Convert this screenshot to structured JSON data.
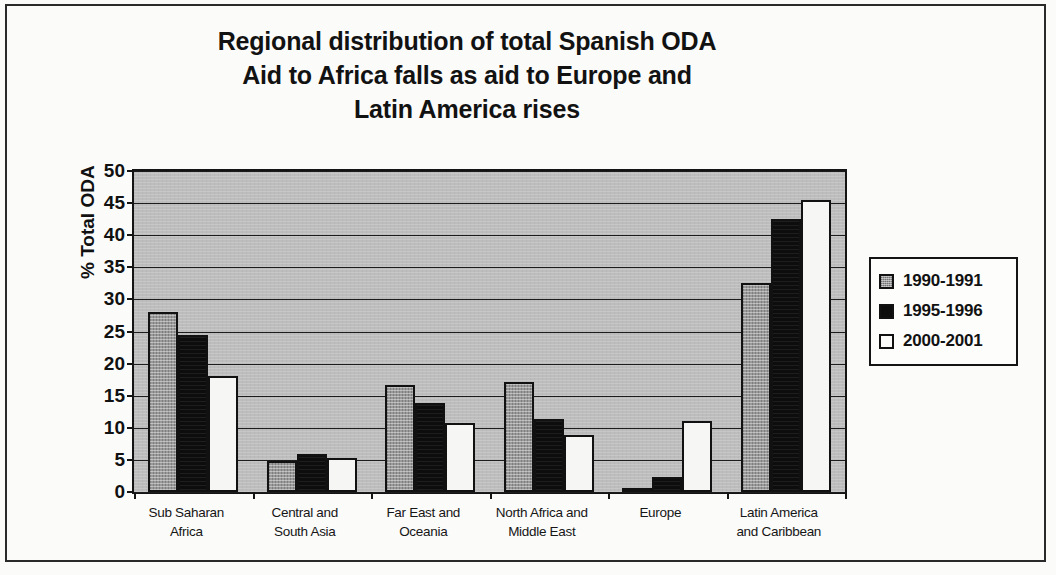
{
  "chart_data": {
    "type": "bar",
    "title": "Regional distribution of total Spanish ODA Aid to Africa falls as aid to Europe and Latin America rises",
    "title_lines": [
      "Regional distribution of total Spanish ODA",
      "Aid to Africa falls as aid to Europe and",
      "Latin America rises"
    ],
    "xlabel": "",
    "ylabel": "% Total ODA",
    "ylim": [
      0,
      50
    ],
    "ytick_step": 5,
    "yticks": [
      0,
      5,
      10,
      15,
      20,
      25,
      30,
      35,
      40,
      45,
      50
    ],
    "ytick_labels": [
      "0",
      "5",
      "10",
      "15",
      "20",
      "25",
      "30",
      "35",
      "40",
      "45",
      "50"
    ],
    "grid": true,
    "legend_position": "right",
    "plot_background": "#bdbdbd",
    "categories": [
      "Sub Saharan Africa",
      "Central and South Asia",
      "Far East and Oceania",
      "North Africa and Middle East",
      "Europe",
      "Latin America and Caribbean"
    ],
    "category_lines": [
      [
        "Sub Saharan",
        "Africa"
      ],
      [
        "Central and",
        "South Asia"
      ],
      [
        "Far East and",
        "Oceania"
      ],
      [
        "North Africa and",
        "Middle East"
      ],
      [
        "Europe",
        ""
      ],
      [
        "Latin America",
        "and Caribbean"
      ]
    ],
    "series": [
      {
        "name": "1990-1991",
        "fill": "hatched-gray",
        "color": "#9a9a9a",
        "values": [
          28.0,
          4.8,
          16.6,
          17.2,
          0.6,
          32.5
        ]
      },
      {
        "name": "1995-1996",
        "fill": "solid-black",
        "color": "#0d0d0d",
        "values": [
          24.5,
          5.9,
          13.9,
          11.3,
          2.4,
          42.5
        ]
      },
      {
        "name": "2000-2001",
        "fill": "white",
        "color": "#f6f6f4",
        "values": [
          18.0,
          5.3,
          10.7,
          8.9,
          11.0,
          45.5
        ]
      }
    ]
  },
  "legend": {
    "items": [
      {
        "label": "1990-1991",
        "swatch": "hatched-gray-swatch"
      },
      {
        "label": "1995-1996",
        "swatch": "solid-black-swatch"
      },
      {
        "label": "2000-2001",
        "swatch": "white-swatch"
      }
    ]
  }
}
